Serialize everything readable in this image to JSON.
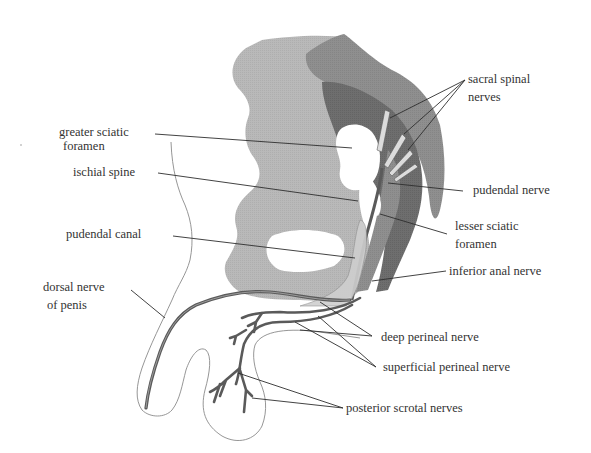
{
  "diagram": {
    "colors": {
      "background": "#ffffff",
      "bone_light": "#b9b9b9",
      "ligament_mid": "#8f8f8f",
      "muscle_dark": "#6e6e6e",
      "nerve": "#5a5a5a",
      "nerve_light": "#d6d6d6",
      "outline": "#7a7a7a",
      "leader_line": "#2e2e2e",
      "text": "#333333"
    },
    "labels": {
      "greater_sciatic_foramen": {
        "line1": "greater sciatic",
        "line2": "foramen"
      },
      "ischial_spine": {
        "line1": "ischial spine"
      },
      "pudendal_canal": {
        "line1": "pudendal canal"
      },
      "dorsal_nerve_of_penis": {
        "line1": "dorsal nerve",
        "line2": "of penis"
      },
      "sacral_spinal_nerves": {
        "line1": "sacral spinal",
        "line2": "nerves"
      },
      "pudendal_nerve": {
        "line1": "pudendal nerve"
      },
      "lesser_sciatic_foramen": {
        "line1": "lesser sciatic",
        "line2": "foramen"
      },
      "inferior_anal_nerve": {
        "line1": "inferior anal nerve"
      },
      "deep_perineal_nerve": {
        "line1": "deep perineal nerve"
      },
      "superficial_perineal_nerve": {
        "line1": "superficial perineal nerve"
      },
      "posterior_scrotal_nerves": {
        "line1": "posterior scrotal nerves"
      }
    }
  }
}
